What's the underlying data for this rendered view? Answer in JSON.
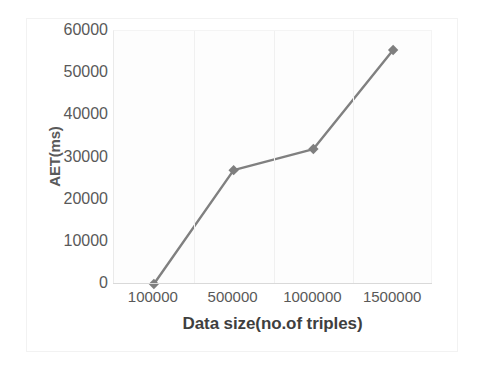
{
  "chart_data": {
    "type": "line",
    "title": "",
    "xlabel": "Data size(no.of triples)",
    "ylabel": "AET(ms)",
    "categories": [
      "100000",
      "500000",
      "1000000",
      "1500000"
    ],
    "values": [
      0,
      27000,
      32000,
      55500
    ],
    "series": [
      {
        "name": "AET",
        "values": [
          0,
          27000,
          32000,
          55500
        ],
        "color": "#808080",
        "marker": "diamond"
      }
    ],
    "y_ticks": [
      60000,
      50000,
      40000,
      30000,
      20000,
      10000,
      0
    ],
    "y_tick_labels": [
      "60000",
      "50000",
      "40000",
      "30000",
      "20000",
      "10000",
      "0"
    ],
    "x_tick_labels": [
      "100000",
      "500000",
      "1000000",
      "1500000"
    ],
    "ylim": [
      0,
      60000
    ],
    "grid": "vertical-only",
    "legend": "none",
    "colors": {
      "series_line": "#808080",
      "marker_fill": "#7f7f7f",
      "gridline": "#f0f0f0",
      "axis_line": "#d9d9d9",
      "tick_text": "#595959",
      "axis_title_text": "#3f3f3f",
      "plot_background": "#fdfdfd",
      "page_background": "#ffffff"
    }
  }
}
